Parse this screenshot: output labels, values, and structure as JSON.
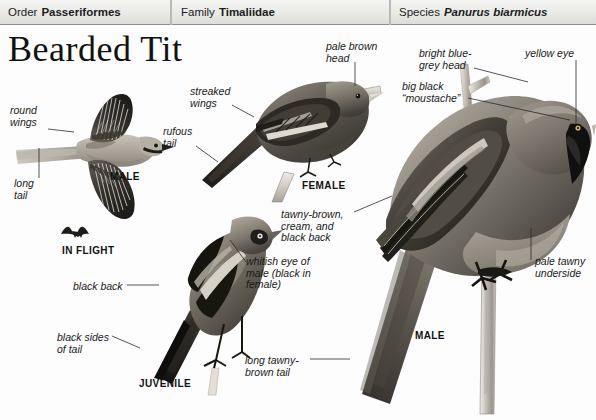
{
  "taxonomy": [
    {
      "label": "Order",
      "value": "Passeriformes",
      "italic": false
    },
    {
      "label": "Family",
      "value": "Timaliidae",
      "italic": false
    },
    {
      "label": "Species",
      "value": "Panurus biarmicus",
      "italic": true
    }
  ],
  "title": "Bearded Tit",
  "annotations": {
    "round_wings": "round\nwings",
    "long_tail": "long\ntail",
    "streaked_wings": "streaked\nwings",
    "rufous_tail": "rufous\ntail",
    "pale_brown_head": "pale brown\nhead",
    "bright_blue_grey_head": "bright blue-\ngrey head",
    "big_black_moustache": "big black\n“moustache”",
    "yellow_eye": "yellow eye",
    "tawny_brown_cream_black_back": "tawny-brown,\ncream, and\nblack back",
    "whitish_eye": "whitish eye of\nmale (black in\nfemale)",
    "black_back": "black back",
    "black_sides_of_tail": "black sides\nof tail",
    "long_tawny_brown_tail": "long tawny-\nbrown tail",
    "pale_tawny_underside": "pale tawny\nunderside"
  },
  "plate_captions": {
    "male_flight": "MALE",
    "in_flight": "IN FLIGHT",
    "female": "FEMALE",
    "juvenile": "JUVENILE",
    "male": "MALE"
  },
  "colors": {
    "header_text": "#1c1c1c",
    "header_bg": "#e9e9e6",
    "header_rule": "#8e8e8c",
    "label_text": "#1a1a1a",
    "leader_line": "#2a2a2a",
    "page_bg": "#ffffff",
    "bird_dark": "#2b2b2b",
    "bird_mid": "#6e6a64",
    "bird_light": "#b9b4ab",
    "bird_pale": "#dedad2"
  }
}
